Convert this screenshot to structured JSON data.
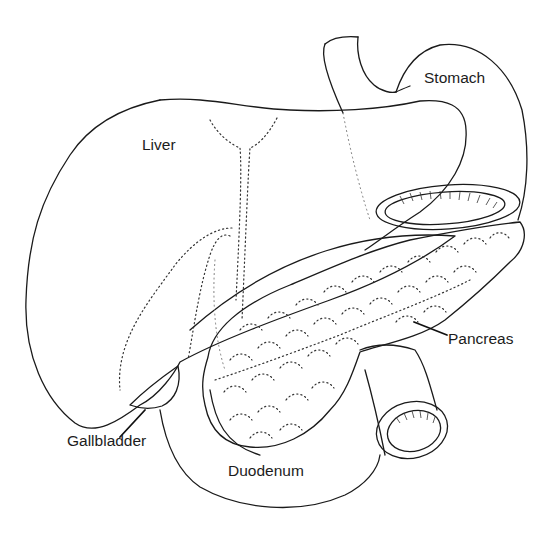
{
  "figure": {
    "type": "anatomical line drawing",
    "background_color": "#ffffff",
    "ink_color": "#1a1a1a"
  },
  "labels": {
    "liver": "Liver",
    "stomach": "Stomach",
    "pancreas": "Pancreas",
    "gallbladder": "Gallbladder",
    "duodenum": "Duodenum"
  }
}
